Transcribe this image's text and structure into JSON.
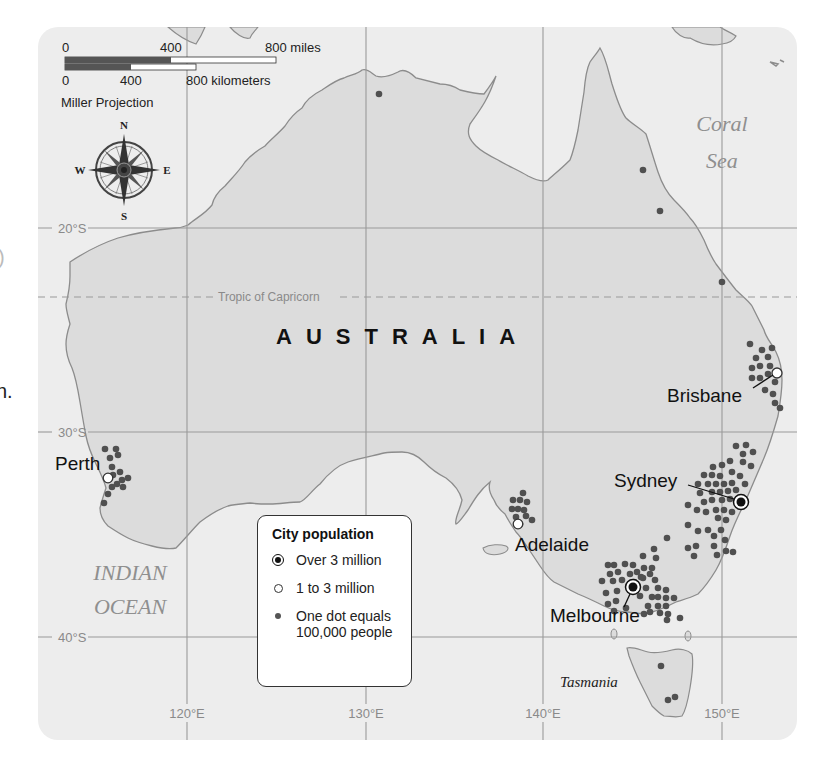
{
  "map": {
    "title": "AUSTRALIA",
    "projection": "Miller Projection",
    "colors": {
      "sea": "#ededed",
      "land": "#dcdcdc",
      "coast": "#8c8c8c",
      "grid": "#9a9a9a",
      "dot": "#505050",
      "scale_dark": "#555555"
    }
  },
  "scale_bar": {
    "miles": {
      "labels": [
        "0",
        "400",
        "800 miles"
      ]
    },
    "kilometers": {
      "labels": [
        "0",
        "400",
        "800 kilometers"
      ]
    },
    "projection_label": "Miller Projection"
  },
  "compass": {
    "n": "N",
    "s": "S",
    "e": "E",
    "w": "W"
  },
  "grid": {
    "latitudes": [
      {
        "label": "20°S"
      },
      {
        "label": "30°S"
      },
      {
        "label": "40°S"
      }
    ],
    "longitudes": [
      {
        "label": "120°E"
      },
      {
        "label": "130°E"
      },
      {
        "label": "140°E"
      },
      {
        "label": "150°E"
      }
    ],
    "tropic_label": "Tropic of Capricorn"
  },
  "water_labels": {
    "coral_line1": "Coral",
    "coral_line2": "Sea",
    "indian_line1": "INDIAN",
    "indian_line2": "OCEAN"
  },
  "place_labels": {
    "tasmania": "Tasmania"
  },
  "cities": [
    {
      "name": "Perth",
      "category": "1 to 3 million"
    },
    {
      "name": "Adelaide",
      "category": "1 to 3 million"
    },
    {
      "name": "Melbourne",
      "category": "Over 3 million"
    },
    {
      "name": "Sydney",
      "category": "Over 3 million"
    },
    {
      "name": "Brisbane",
      "category": "1 to 3 million"
    }
  ],
  "legend": {
    "title": "City population",
    "items": [
      {
        "symbol": "over-3-million-icon",
        "label": "Over 3 million"
      },
      {
        "symbol": "1-to-3-million-icon",
        "label": "1 to 3 million"
      },
      {
        "symbol": "population-dot-icon",
        "label_line1": "One dot equals",
        "label_line2": "100,000 people"
      }
    ]
  },
  "edge_fragments": {
    "upper": ")",
    "lower": "n."
  }
}
